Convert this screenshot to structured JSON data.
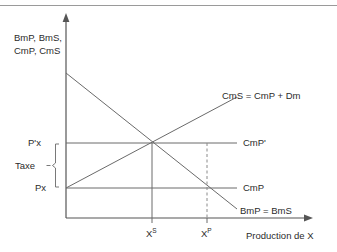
{
  "figure": {
    "type": "economics-externality-diagram",
    "axis": {
      "y_label_line1": "BmP, BmS,",
      "y_label_line2": "CmP, CmS",
      "x_label": "Production de X"
    },
    "y_ticks": [
      {
        "id": "p-prime-x",
        "label": "P'x",
        "y_px": 143
      },
      {
        "id": "px",
        "label": "Px",
        "y_px": 188
      }
    ],
    "x_ticks": [
      {
        "id": "xs",
        "base": "X",
        "sup": "S",
        "x_px": 152
      },
      {
        "id": "xp",
        "base": "X",
        "sup": "P",
        "x_px": 207
      }
    ],
    "curves": [
      {
        "id": "social-marginal-cost",
        "label": "CmS = CmP + Dm",
        "direction": "upward",
        "from": [
          66,
          188
        ],
        "to": [
          237,
          97
        ]
      },
      {
        "id": "marginal-benefit",
        "label": "BmP = BmS",
        "direction": "downward",
        "from": [
          66,
          73
        ],
        "to": [
          237,
          209
        ]
      }
    ],
    "horizontals": [
      {
        "id": "cmp-prime-line",
        "label": "CmP'",
        "y_px": 143,
        "x_end": 237
      },
      {
        "id": "cmp-line",
        "label": "CmP",
        "y_px": 188,
        "x_end": 237
      }
    ],
    "annotations": [
      {
        "id": "tax-bracket",
        "label": "Taxe"
      }
    ],
    "colors": {
      "axis": "#555555",
      "curve": "#6a6a6a",
      "text": "#2b2b2b",
      "dashed": "#8a8a8a",
      "rule": "#9a9a9a"
    }
  }
}
